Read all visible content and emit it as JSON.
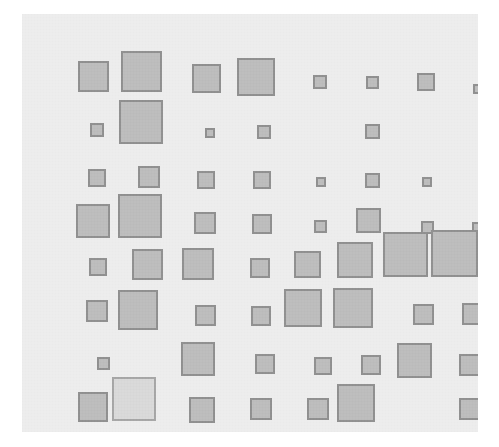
{
  "chart_data": {
    "type": "heatmap",
    "title": "",
    "subtitle": "",
    "xlabel": "",
    "ylabel": "",
    "grid": false,
    "legend": "none",
    "glyph": "square",
    "encoding": "area",
    "background_color": "#ededed",
    "glyph_fill": "#bdbdbd",
    "glyph_stroke": "#909090",
    "glyph_fill_highlight": "#d9d9d9",
    "glyph_stroke_highlight": "#a6a6a6",
    "columns": [
      "C1",
      "C2",
      "C3",
      "C4",
      "C5",
      "C6",
      "C7",
      "C8"
    ],
    "rows": [
      "R1",
      "R2",
      "R3",
      "R4",
      "R5",
      "R6",
      "R7",
      "R8"
    ],
    "col_centers": [
      75,
      124,
      184,
      240,
      298,
      350,
      404,
      456
    ],
    "row_centers": [
      66,
      119,
      167,
      209,
      256,
      302,
      350,
      397
    ],
    "values": [
      [
        31,
        41,
        29,
        38,
        14,
        13,
        18,
        10
      ],
      [
        14,
        44,
        10,
        14,
        0,
        15,
        0,
        0
      ],
      [
        18,
        22,
        18,
        18,
        10,
        15,
        10,
        0
      ],
      [
        34,
        44,
        22,
        20,
        13,
        25,
        13,
        11
      ],
      [
        18,
        31,
        32,
        0,
        20,
        27,
        36,
        45,
        47
      ],
      [
        22,
        40,
        21,
        20,
        38,
        40,
        21,
        22
      ],
      [
        13,
        0,
        34,
        20,
        18,
        20,
        35,
        22
      ],
      [
        30,
        44,
        26,
        22,
        22,
        38,
        0,
        22
      ]
    ],
    "cells": [
      {
        "row": 0,
        "col": 0,
        "x": 56,
        "y": 47,
        "size": 31,
        "value": 31,
        "highlight": false
      },
      {
        "row": 0,
        "col": 1,
        "x": 99,
        "y": 37,
        "size": 41,
        "value": 41,
        "highlight": false
      },
      {
        "row": 0,
        "col": 2,
        "x": 170,
        "y": 50,
        "size": 29,
        "value": 29,
        "highlight": false
      },
      {
        "row": 0,
        "col": 3,
        "x": 215,
        "y": 44,
        "size": 38,
        "value": 38,
        "highlight": false
      },
      {
        "row": 0,
        "col": 4,
        "x": 291,
        "y": 61,
        "size": 14,
        "value": 14,
        "highlight": false
      },
      {
        "row": 0,
        "col": 5,
        "x": 344,
        "y": 62,
        "size": 13,
        "value": 13,
        "highlight": false
      },
      {
        "row": 0,
        "col": 6,
        "x": 395,
        "y": 59,
        "size": 18,
        "value": 18,
        "highlight": false
      },
      {
        "row": 0,
        "col": 7,
        "x": 451,
        "y": 70,
        "size": 10,
        "value": 10,
        "highlight": false
      },
      {
        "row": 1,
        "col": 0,
        "x": 68,
        "y": 109,
        "size": 14,
        "value": 14,
        "highlight": false
      },
      {
        "row": 1,
        "col": 1,
        "x": 97,
        "y": 86,
        "size": 44,
        "value": 44,
        "highlight": false
      },
      {
        "row": 1,
        "col": 2,
        "x": 183,
        "y": 114,
        "size": 10,
        "value": 10,
        "highlight": false
      },
      {
        "row": 1,
        "col": 3,
        "x": 235,
        "y": 111,
        "size": 14,
        "value": 14,
        "highlight": false
      },
      {
        "row": 1,
        "col": 5,
        "x": 343,
        "y": 110,
        "size": 15,
        "value": 15,
        "highlight": false
      },
      {
        "row": 2,
        "col": 0,
        "x": 66,
        "y": 155,
        "size": 18,
        "value": 18,
        "highlight": false
      },
      {
        "row": 2,
        "col": 1,
        "x": 116,
        "y": 152,
        "size": 22,
        "value": 22,
        "highlight": false
      },
      {
        "row": 2,
        "col": 2,
        "x": 175,
        "y": 157,
        "size": 18,
        "value": 18,
        "highlight": false
      },
      {
        "row": 2,
        "col": 3,
        "x": 231,
        "y": 157,
        "size": 18,
        "value": 18,
        "highlight": false
      },
      {
        "row": 2,
        "col": 4,
        "x": 294,
        "y": 163,
        "size": 10,
        "value": 10,
        "highlight": false
      },
      {
        "row": 2,
        "col": 5,
        "x": 343,
        "y": 159,
        "size": 15,
        "value": 15,
        "highlight": false
      },
      {
        "row": 2,
        "col": 6,
        "x": 400,
        "y": 163,
        "size": 10,
        "value": 10,
        "highlight": false
      },
      {
        "row": 3,
        "col": 0,
        "x": 54,
        "y": 190,
        "size": 34,
        "value": 34,
        "highlight": false
      },
      {
        "row": 3,
        "col": 1,
        "x": 96,
        "y": 180,
        "size": 44,
        "value": 44,
        "highlight": false
      },
      {
        "row": 3,
        "col": 2,
        "x": 172,
        "y": 198,
        "size": 22,
        "value": 22,
        "highlight": false
      },
      {
        "row": 3,
        "col": 3,
        "x": 230,
        "y": 200,
        "size": 20,
        "value": 20,
        "highlight": false
      },
      {
        "row": 3,
        "col": 4,
        "x": 292,
        "y": 206,
        "size": 13,
        "value": 13,
        "highlight": false
      },
      {
        "row": 3,
        "col": 5,
        "x": 334,
        "y": 194,
        "size": 25,
        "value": 25,
        "highlight": false
      },
      {
        "row": 3,
        "col": 6,
        "x": 399,
        "y": 207,
        "size": 13,
        "value": 13,
        "highlight": false
      },
      {
        "row": 3,
        "col": 7,
        "x": 450,
        "y": 208,
        "size": 11,
        "value": 11,
        "highlight": false
      },
      {
        "row": 4,
        "col": 0,
        "x": 67,
        "y": 244,
        "size": 18,
        "value": 18,
        "highlight": false
      },
      {
        "row": 4,
        "col": 1,
        "x": 110,
        "y": 235,
        "size": 31,
        "value": 31,
        "highlight": false
      },
      {
        "row": 4,
        "col": 2,
        "x": 160,
        "y": 234,
        "size": 32,
        "value": 32,
        "highlight": false
      },
      {
        "row": 4,
        "col": 4,
        "x": 228,
        "y": 244,
        "size": 20,
        "value": 20,
        "highlight": false
      },
      {
        "row": 4,
        "col": 5,
        "x": 272,
        "y": 237,
        "size": 27,
        "value": 27,
        "highlight": false
      },
      {
        "row": 4,
        "col": 6,
        "x": 315,
        "y": 228,
        "size": 36,
        "value": 36,
        "highlight": false
      },
      {
        "row": 4,
        "col": 7,
        "x": 361,
        "y": 218,
        "size": 45,
        "value": 45,
        "highlight": false
      },
      {
        "row": 4,
        "col": 8,
        "x": 409,
        "y": 216,
        "size": 47,
        "value": 47,
        "highlight": false
      },
      {
        "row": 5,
        "col": 0,
        "x": 64,
        "y": 286,
        "size": 22,
        "value": 22,
        "highlight": false
      },
      {
        "row": 5,
        "col": 1,
        "x": 96,
        "y": 276,
        "size": 40,
        "value": 40,
        "highlight": false
      },
      {
        "row": 5,
        "col": 2,
        "x": 173,
        "y": 291,
        "size": 21,
        "value": 21,
        "highlight": false
      },
      {
        "row": 5,
        "col": 3,
        "x": 229,
        "y": 292,
        "size": 20,
        "value": 20,
        "highlight": false
      },
      {
        "row": 5,
        "col": 4,
        "x": 262,
        "y": 275,
        "size": 38,
        "value": 38,
        "highlight": false
      },
      {
        "row": 5,
        "col": 5,
        "x": 311,
        "y": 274,
        "size": 40,
        "value": 40,
        "highlight": false
      },
      {
        "row": 5,
        "col": 6,
        "x": 391,
        "y": 290,
        "size": 21,
        "value": 21,
        "highlight": false
      },
      {
        "row": 5,
        "col": 7,
        "x": 440,
        "y": 289,
        "size": 22,
        "value": 22,
        "highlight": false
      },
      {
        "row": 6,
        "col": 0,
        "x": 75,
        "y": 343,
        "size": 13,
        "value": 13,
        "highlight": false
      },
      {
        "row": 6,
        "col": 2,
        "x": 159,
        "y": 328,
        "size": 34,
        "value": 34,
        "highlight": false
      },
      {
        "row": 6,
        "col": 3,
        "x": 233,
        "y": 340,
        "size": 20,
        "value": 20,
        "highlight": false
      },
      {
        "row": 6,
        "col": 4,
        "x": 292,
        "y": 343,
        "size": 18,
        "value": 18,
        "highlight": false
      },
      {
        "row": 6,
        "col": 5,
        "x": 339,
        "y": 341,
        "size": 20,
        "value": 20,
        "highlight": false
      },
      {
        "row": 6,
        "col": 6,
        "x": 375,
        "y": 329,
        "size": 35,
        "value": 35,
        "highlight": false
      },
      {
        "row": 6,
        "col": 7,
        "x": 437,
        "y": 340,
        "size": 22,
        "value": 22,
        "highlight": false
      },
      {
        "row": 7,
        "col": 0,
        "x": 56,
        "y": 378,
        "size": 30,
        "value": 30,
        "highlight": false
      },
      {
        "row": 7,
        "col": 1,
        "x": 90,
        "y": 363,
        "size": 44,
        "value": 44,
        "highlight": true
      },
      {
        "row": 7,
        "col": 2,
        "x": 167,
        "y": 383,
        "size": 26,
        "value": 26,
        "highlight": false
      },
      {
        "row": 7,
        "col": 3,
        "x": 228,
        "y": 384,
        "size": 22,
        "value": 22,
        "highlight": false
      },
      {
        "row": 7,
        "col": 4,
        "x": 285,
        "y": 384,
        "size": 22,
        "value": 22,
        "highlight": false
      },
      {
        "row": 7,
        "col": 5,
        "x": 315,
        "y": 370,
        "size": 38,
        "value": 38,
        "highlight": false
      },
      {
        "row": 7,
        "col": 7,
        "x": 437,
        "y": 384,
        "size": 22,
        "value": 22,
        "highlight": false
      }
    ]
  }
}
